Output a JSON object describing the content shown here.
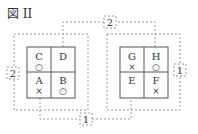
{
  "figure_title": "図 II",
  "colors": {
    "line": "#555555",
    "dashed": "#888888",
    "text": "#333333"
  },
  "left_grid": {
    "cells": [
      {
        "letter": "C",
        "mark": "○"
      },
      {
        "letter": "D",
        "mark": ""
      },
      {
        "letter": "A",
        "mark": "×"
      },
      {
        "letter": "B",
        "mark": "○"
      }
    ]
  },
  "right_grid": {
    "cells": [
      {
        "letter": "G",
        "mark": "×"
      },
      {
        "letter": "H",
        "mark": "○"
      },
      {
        "letter": "E",
        "mark": ""
      },
      {
        "letter": "F",
        "mark": "×"
      }
    ]
  },
  "connectors": {
    "top_label": "2",
    "left_label": "2",
    "right_label": "1",
    "bottom_label": "1"
  }
}
